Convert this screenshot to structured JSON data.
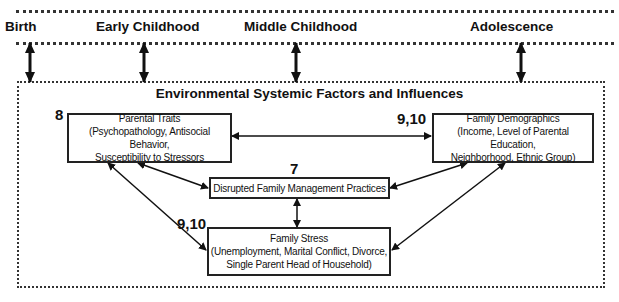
{
  "stages": [
    {
      "label": "Birth",
      "x": 5
    },
    {
      "label": "Early Childhood",
      "x": 96
    },
    {
      "label": "Middle Childhood",
      "x": 244
    },
    {
      "label": "Adolescence",
      "x": 470
    }
  ],
  "environment": {
    "title": "Environmental Systemic Factors and Influences"
  },
  "boxes": {
    "parental_traits": {
      "number": "8",
      "title": "Parental Traits",
      "line1": "(Psychopathology, Antisocial Behavior,",
      "line2": "Susceptibility to Stressors"
    },
    "family_demographics": {
      "number": "9,10",
      "title": "Family Demographics",
      "line1": "(Income, Level of Parental Education,",
      "line2": "Neighborhood, Ethnic Group)"
    },
    "disrupted_management": {
      "number": "7",
      "title": "Disrupted Family Management Practices"
    },
    "family_stress": {
      "number": "9,10",
      "title": "Family Stress",
      "line1": "(Unemployment, Marital Conflict, Divorce,",
      "line2": "Single Parent Head of Household)"
    }
  }
}
